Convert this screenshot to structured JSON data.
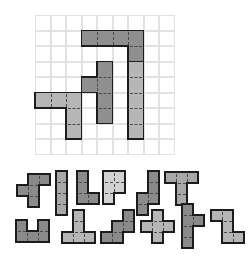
{
  "app": {
    "title": "Pentomino Tiling Puzzle",
    "background_color": "#ffffff"
  },
  "board": {
    "name": "puzzle-board",
    "columns": 9,
    "rows": 9,
    "cell_size": 15.5,
    "origin_x": 35,
    "origin_y": 15,
    "grid_line_color": "#e2e2e2",
    "grid_background": "#ffffff",
    "outline_color": "#1c1c1c",
    "placed_pieces": [
      {
        "id": "placed-1",
        "label": "L-pentomino-top",
        "color": "#8f8f8f",
        "cells": [
          [
            3,
            1
          ],
          [
            4,
            1
          ],
          [
            5,
            1
          ],
          [
            6,
            1
          ],
          [
            6,
            2
          ]
        ]
      },
      {
        "id": "placed-2",
        "label": "T-pentomino-center",
        "color": "#8f8f8f",
        "cells": [
          [
            4,
            3
          ],
          [
            4,
            4
          ],
          [
            4,
            5
          ],
          [
            4,
            6
          ],
          [
            3,
            4
          ]
        ]
      },
      {
        "id": "placed-3",
        "label": "J-pentomino-left",
        "color": "#b6b6b6",
        "cells": [
          [
            0,
            5
          ],
          [
            1,
            5
          ],
          [
            2,
            5
          ],
          [
            2,
            6
          ],
          [
            2,
            7
          ]
        ]
      },
      {
        "id": "placed-4",
        "label": "I-pentomino-right",
        "color": "#b6b6b6",
        "cells": [
          [
            6,
            3
          ],
          [
            6,
            4
          ],
          [
            6,
            5
          ],
          [
            6,
            6
          ],
          [
            6,
            7
          ]
        ]
      }
    ]
  },
  "tray": {
    "name": "piece-tray",
    "cell_size": 11,
    "rows": 2,
    "pieces": [
      {
        "id": "tray-1",
        "label": "F-pentomino",
        "color": "#8a8a8a",
        "x": 17,
        "y": 6,
        "cells": [
          [
            1,
            0
          ],
          [
            2,
            0
          ],
          [
            0,
            1
          ],
          [
            1,
            1
          ],
          [
            1,
            2
          ]
        ]
      },
      {
        "id": "tray-2",
        "label": "I-pentomino",
        "color": "#a8a8a8",
        "x": 56,
        "y": 3,
        "cells": [
          [
            0,
            0
          ],
          [
            0,
            1
          ],
          [
            0,
            2
          ],
          [
            0,
            3
          ]
        ]
      },
      {
        "id": "tray-3",
        "label": "L-pentomino",
        "color": "#8a8a8a",
        "x": 77,
        "y": 3,
        "cells": [
          [
            0,
            0
          ],
          [
            0,
            1
          ],
          [
            0,
            2
          ],
          [
            1,
            2
          ]
        ]
      },
      {
        "id": "tray-4",
        "label": "P-pentomino",
        "color": "#d2d2d2",
        "x": 103,
        "y": 3,
        "cells": [
          [
            0,
            0
          ],
          [
            1,
            0
          ],
          [
            0,
            1
          ],
          [
            1,
            1
          ],
          [
            0,
            2
          ]
        ]
      },
      {
        "id": "tray-5",
        "label": "S-pentomino",
        "color": "#8a8a8a",
        "x": 137,
        "y": 3,
        "cells": [
          [
            1,
            0
          ],
          [
            1,
            1
          ],
          [
            0,
            2
          ],
          [
            1,
            2
          ],
          [
            0,
            3
          ]
        ]
      },
      {
        "id": "tray-6",
        "label": "T-pentomino",
        "color": "#a8a8a8",
        "x": 165,
        "y": 4,
        "cells": [
          [
            0,
            0
          ],
          [
            1,
            0
          ],
          [
            2,
            0
          ],
          [
            1,
            1
          ],
          [
            1,
            2
          ]
        ]
      },
      {
        "id": "tray-7",
        "label": "U-pentomino",
        "color": "#8a8a8a",
        "x": 16,
        "y": 52,
        "cells": [
          [
            0,
            0
          ],
          [
            2,
            0
          ],
          [
            0,
            1
          ],
          [
            1,
            1
          ],
          [
            2,
            1
          ]
        ]
      },
      {
        "id": "tray-8",
        "label": "V-pentomino",
        "color": "#b6b6b6",
        "x": 62,
        "y": 42,
        "cells": [
          [
            1,
            0
          ],
          [
            1,
            1
          ],
          [
            0,
            2
          ],
          [
            1,
            2
          ],
          [
            2,
            2
          ]
        ]
      },
      {
        "id": "tray-9",
        "label": "W-pentomino",
        "color": "#8a8a8a",
        "x": 101,
        "y": 42,
        "cells": [
          [
            2,
            0
          ],
          [
            1,
            1
          ],
          [
            2,
            1
          ],
          [
            0,
            2
          ],
          [
            1,
            2
          ]
        ]
      },
      {
        "id": "tray-10",
        "label": "X-pentomino",
        "color": "#b6b6b6",
        "x": 141,
        "y": 42,
        "cells": [
          [
            1,
            0
          ],
          [
            0,
            1
          ],
          [
            1,
            1
          ],
          [
            2,
            1
          ],
          [
            1,
            2
          ]
        ]
      },
      {
        "id": "tray-11",
        "label": "Y-pentomino",
        "color": "#8a8a8a",
        "x": 182,
        "y": 36,
        "cells": [
          [
            0,
            0
          ],
          [
            0,
            1
          ],
          [
            1,
            1
          ],
          [
            0,
            2
          ],
          [
            0,
            3
          ]
        ]
      },
      {
        "id": "tray-12",
        "label": "Z-pentomino",
        "color": "#b6b6b6",
        "x": 211,
        "y": 42,
        "cells": [
          [
            0,
            0
          ],
          [
            1,
            0
          ],
          [
            1,
            1
          ],
          [
            1,
            2
          ],
          [
            2,
            2
          ]
        ]
      }
    ]
  }
}
